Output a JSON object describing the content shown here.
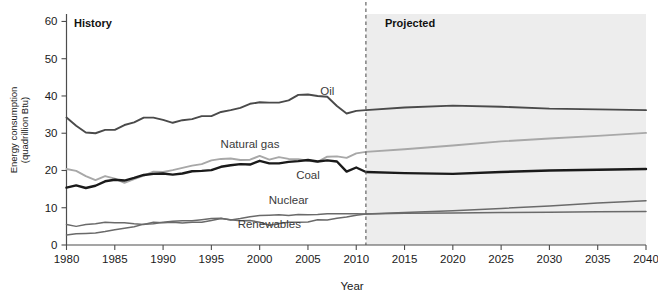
{
  "figure": {
    "background_color": "#ffffff",
    "projected_band_color": "#ededed",
    "divider_year": 2011,
    "history_label": "History",
    "projected_label": "Projected",
    "caption_sliver": ""
  },
  "axes": {
    "x": {
      "label": "Year",
      "min": 1980,
      "max": 2040,
      "ticks": [
        1980,
        1985,
        1990,
        1995,
        2000,
        2005,
        2010,
        2015,
        2020,
        2025,
        2030,
        2035,
        2040
      ],
      "tick_labels": [
        "1980",
        "1985",
        "1990",
        "1995",
        "2000",
        "2005",
        "2010",
        "2015",
        "2020",
        "2025",
        "2030",
        "2035",
        "2040"
      ]
    },
    "y": {
      "label_line1": "Energy consumption",
      "label_line2": "(quadrillion Btu)",
      "min": 0,
      "max": 62,
      "ticks": [
        0,
        10,
        20,
        30,
        40,
        50,
        60
      ],
      "tick_labels": [
        "0",
        "10",
        "20",
        "30",
        "40",
        "50",
        "60"
      ]
    }
  },
  "chart_data": {
    "type": "line",
    "title": "",
    "xlabel": "Year",
    "ylabel": "Energy consumption (quadrillion Btu)",
    "xlim": [
      1980,
      2040
    ],
    "ylim": [
      0,
      62
    ],
    "grid": false,
    "legend_position": "inline-labels",
    "annotations": [
      {
        "text": "History",
        "x": 1981,
        "y": 58,
        "bold": true
      },
      {
        "text": "Projected",
        "x": 2013,
        "y": 58,
        "bold": true
      }
    ],
    "divider": {
      "x": 2011,
      "style": "dashed",
      "label_left": "History",
      "label_right": "Projected"
    },
    "x": [
      1980,
      1981,
      1982,
      1983,
      1984,
      1985,
      1986,
      1987,
      1988,
      1989,
      1990,
      1991,
      1992,
      1993,
      1994,
      1995,
      1996,
      1997,
      1998,
      1999,
      2000,
      2001,
      2002,
      2003,
      2004,
      2005,
      2006,
      2007,
      2008,
      2009,
      2010,
      2011,
      2015,
      2020,
      2025,
      2030,
      2035,
      2040
    ],
    "series": [
      {
        "name": "Oil",
        "color": "#4a4a4a",
        "width": 1.9,
        "label_x": 2007,
        "label_y": 40.2,
        "values": [
          34.2,
          32.0,
          30.2,
          30.0,
          30.9,
          30.9,
          32.2,
          32.9,
          34.2,
          34.2,
          33.6,
          32.8,
          33.5,
          33.8,
          34.6,
          34.6,
          35.7,
          36.2,
          36.8,
          37.9,
          38.3,
          38.2,
          38.2,
          38.8,
          40.3,
          40.4,
          40.0,
          39.8,
          37.3,
          35.3,
          36.0,
          36.2,
          36.9,
          37.4,
          37.1,
          36.6,
          36.4,
          36.2
        ]
      },
      {
        "name": "Natural gas",
        "color": "#a8a8a8",
        "width": 1.9,
        "label_x": 1999,
        "label_y": 26.0,
        "values": [
          20.4,
          19.9,
          18.5,
          17.4,
          18.5,
          17.8,
          16.7,
          17.7,
          18.6,
          19.7,
          19.6,
          20.1,
          20.7,
          21.3,
          21.7,
          22.7,
          23.1,
          23.2,
          22.8,
          22.9,
          23.9,
          22.9,
          23.6,
          23.1,
          23.0,
          22.6,
          22.3,
          23.7,
          23.8,
          23.4,
          24.6,
          25.0,
          25.7,
          26.7,
          27.8,
          28.6,
          29.3,
          30.1
        ]
      },
      {
        "name": "Coal",
        "color": "#1a1a1a",
        "width": 2.4,
        "label_x": 2005,
        "label_y": 17.6,
        "values": [
          15.4,
          16.0,
          15.3,
          15.9,
          17.1,
          17.5,
          17.3,
          18.0,
          18.8,
          19.1,
          19.2,
          18.9,
          19.2,
          19.8,
          19.9,
          20.1,
          21.0,
          21.4,
          21.7,
          21.6,
          22.6,
          21.9,
          21.9,
          22.3,
          22.5,
          22.8,
          22.4,
          22.7,
          22.4,
          19.7,
          20.8,
          19.6,
          19.3,
          19.1,
          19.6,
          20.0,
          20.2,
          20.4
        ]
      },
      {
        "name": "Nuclear",
        "color": "#6a6a6a",
        "width": 1.5,
        "label_x": 2003,
        "label_y": 11.0,
        "values": [
          2.7,
          3.0,
          3.1,
          3.2,
          3.6,
          4.1,
          4.5,
          4.9,
          5.6,
          5.7,
          6.1,
          6.4,
          6.5,
          6.5,
          6.8,
          7.1,
          7.2,
          6.7,
          7.1,
          7.6,
          7.9,
          8.0,
          8.1,
          7.9,
          8.2,
          8.1,
          8.2,
          8.4,
          8.4,
          8.4,
          8.4,
          8.3,
          8.5,
          8.6,
          8.7,
          8.8,
          8.9,
          9.0
        ]
      },
      {
        "name": "Renewables",
        "color": "#6a6a6a",
        "width": 1.5,
        "label_x": 2001,
        "label_y": 4.5,
        "values": [
          5.5,
          5.0,
          5.5,
          5.7,
          6.1,
          6.0,
          6.0,
          5.7,
          5.5,
          6.1,
          6.0,
          6.1,
          5.9,
          6.1,
          6.1,
          6.6,
          7.1,
          6.8,
          6.5,
          6.6,
          6.1,
          5.3,
          5.8,
          6.1,
          6.1,
          6.2,
          6.8,
          6.7,
          7.2,
          7.5,
          8.0,
          8.3,
          8.7,
          9.2,
          9.8,
          10.5,
          11.3,
          11.9
        ]
      }
    ]
  }
}
